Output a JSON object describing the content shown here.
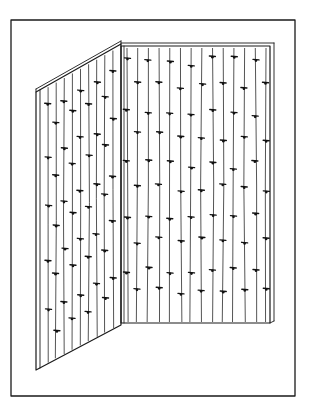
{
  "illustration": {
    "description": "Line drawing of a two-panel corner screen with vertical threads and small knotted ties",
    "colors": {
      "ink": "#1a1a1a",
      "background": "#ffffff"
    },
    "frame": {
      "x": 11,
      "y": 20,
      "width": 284,
      "height": 376
    },
    "left_panel": {
      "top_outer": [
        36,
        92
      ],
      "top_inner": [
        121,
        44
      ],
      "bottom_outer": [
        36,
        370
      ],
      "bottom_inner": [
        121,
        325
      ],
      "edge_thickness": 4,
      "thread_count": 9
    },
    "right_panel": {
      "top_left": [
        121,
        46
      ],
      "top_right": [
        270,
        46
      ],
      "bottom_left": [
        121,
        323
      ],
      "bottom_right": [
        270,
        323
      ],
      "edge_thickness": 4,
      "thread_count": 14
    },
    "knot_rows": 5
  }
}
